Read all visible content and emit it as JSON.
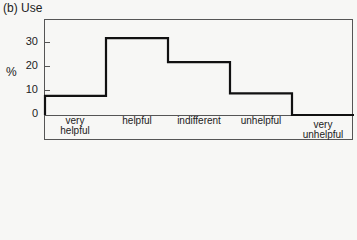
{
  "title": "(b)  Use",
  "yunit": "%",
  "chart_data": {
    "type": "bar",
    "subtype": "step-histogram",
    "title": "(b) Use",
    "xlabel": "",
    "ylabel": "%",
    "categories": [
      "very helpful",
      "helpful",
      "indifferent",
      "unhelpful",
      "very unhelpful"
    ],
    "values": [
      8,
      32,
      22,
      9,
      0
    ],
    "yticks": [
      0,
      10,
      20,
      30
    ],
    "ylim": [
      0,
      40
    ],
    "grid": false,
    "legend": null
  },
  "ticks": [
    {
      "label": "30"
    },
    {
      "label": "20"
    },
    {
      "label": "10"
    },
    {
      "label": "0"
    }
  ],
  "xlabels": [
    {
      "line1": "very",
      "line2": "helpful"
    },
    {
      "line1": "helpful",
      "line2": ""
    },
    {
      "line1": "indifferent",
      "line2": ""
    },
    {
      "line1": "unhelpful",
      "line2": ""
    },
    {
      "line1": "very",
      "line2": "unhelpful"
    }
  ]
}
